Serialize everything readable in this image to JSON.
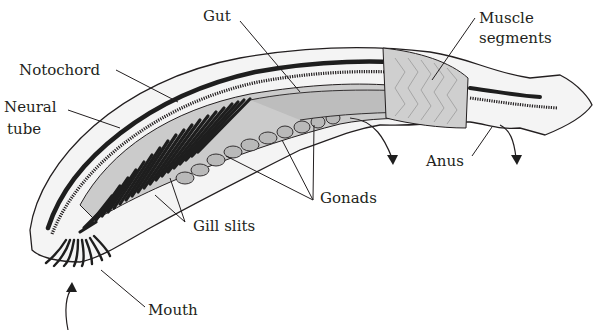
{
  "figure": {
    "colors": {
      "outline": "#231f20",
      "body_fill": "#f2f2f2",
      "organ_fill": "#c8c8c8",
      "muscle_fill": "#cfcfcf",
      "dark_fill": "#2a2a2a",
      "background": "#ffffff"
    }
  },
  "labels": {
    "gut": "Gut",
    "muscle_line1": "Muscle",
    "muscle_line2": "segments",
    "notochord": "Notochord",
    "neural_line1": "Neural",
    "neural_line2": "tube",
    "anus": "Anus",
    "gonads": "Gonads",
    "gill_slits": "Gill slits",
    "mouth": "Mouth"
  }
}
